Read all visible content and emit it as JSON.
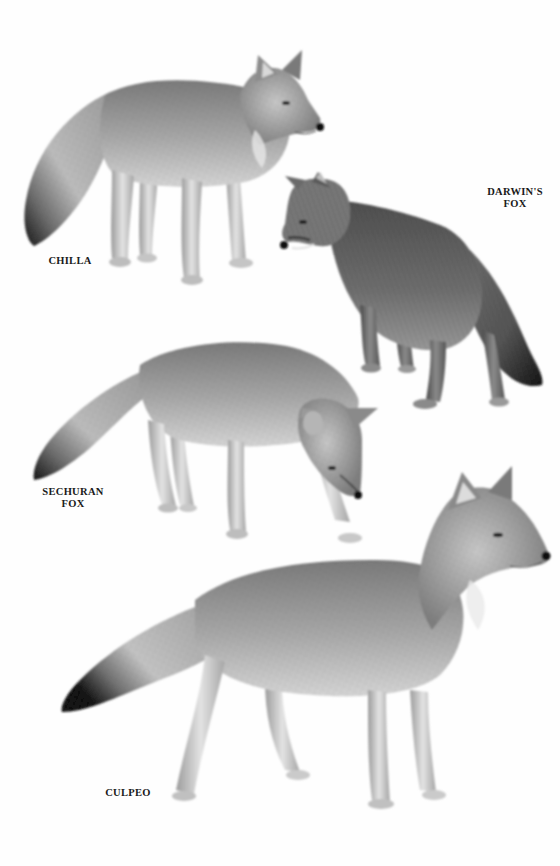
{
  "plate": {
    "background": "#fefefe",
    "ink_color": "#1a1a1a",
    "style": "grayscale pencil illustration"
  },
  "figures": [
    {
      "species": "Chilla",
      "caption_lines": [
        "CHILLA"
      ],
      "pose": "standing, facing right, head turned slightly",
      "tail_tip": "dark"
    },
    {
      "species": "Darwin's Fox",
      "caption_lines": [
        "DARWIN'S",
        "FOX"
      ],
      "pose": "standing, facing left, viewed from rear three-quarter",
      "tail_tip": "dark"
    },
    {
      "species": "Sechuran Fox",
      "caption_lines": [
        "SECHURAN",
        "FOX"
      ],
      "pose": "head lowered, sniffing, facing right",
      "tail_tip": "dark"
    },
    {
      "species": "Culpeo",
      "caption_lines": [
        "CULPEO"
      ],
      "pose": "standing alert, facing right",
      "tail_tip": "dark"
    }
  ]
}
